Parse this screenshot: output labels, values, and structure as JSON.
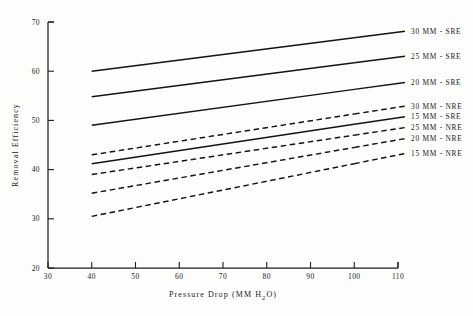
{
  "chart_data": {
    "type": "line",
    "title": "",
    "xlabel": "Pressure Drop (MM H2O)",
    "xlabel_parts": {
      "pre": "Pressure Drop (MM H",
      "sub": "2",
      "post": "O)"
    },
    "ylabel": "Removal Efficiency",
    "xlim": [
      30,
      110
    ],
    "ylim": [
      20,
      70
    ],
    "xticks": [
      30,
      40,
      50,
      60,
      70,
      80,
      90,
      100,
      110
    ],
    "yticks": [
      20,
      30,
      40,
      50,
      60,
      70
    ],
    "grid": false,
    "legend_position": "right-inline",
    "x": [
      40,
      100
    ],
    "series": [
      {
        "name": "30 MM - SRE",
        "label": "30 MM - SRE",
        "style": "solid",
        "values": [
          60.0,
          66.8
        ]
      },
      {
        "name": "25 MM - SRE",
        "label": "25 MM - SRE",
        "style": "solid",
        "values": [
          54.8,
          61.7
        ]
      },
      {
        "name": "20 MM - SRE",
        "label": "20 MM - SRE",
        "style": "solid",
        "values": [
          49.0,
          56.3
        ]
      },
      {
        "name": "30 MM - NRE",
        "label": "30 MM - NRE",
        "style": "dashed",
        "values": [
          43.0,
          51.3
        ]
      },
      {
        "name": "15 MM - SRE",
        "label": "15 MM - SRE",
        "style": "solid",
        "values": [
          41.2,
          49.2
        ]
      },
      {
        "name": "25 MM - NRE",
        "label": "25 MM - NRE",
        "style": "dashed",
        "values": [
          39.0,
          47.0
        ]
      },
      {
        "name": "20 MM - NRE",
        "label": "20 MM - NRE",
        "style": "dashed",
        "values": [
          35.2,
          44.5
        ]
      },
      {
        "name": "15 MM - NRE",
        "label": "15 MM - NRE",
        "style": "dashed",
        "values": [
          30.5,
          41.2
        ]
      }
    ],
    "legend_entries": [
      {
        "label": "30 MM - SRE",
        "style": "solid"
      },
      {
        "label": "25 MM - SRE",
        "style": "solid"
      },
      {
        "label": "20 MM - SRE",
        "style": "solid"
      },
      {
        "label": "30 MM - NRE",
        "style": "dashed"
      },
      {
        "label": "15 MM - SRE",
        "style": "solid"
      },
      {
        "label": "25 MM - NRE",
        "style": "dashed"
      },
      {
        "label": "20 MM - NRE",
        "style": "dashed"
      },
      {
        "label": "15 MM - NRE",
        "style": "dashed"
      }
    ],
    "colors": {
      "ink": "#131313",
      "axis": "#1d1d1d",
      "background": "#fdfdfb"
    }
  }
}
